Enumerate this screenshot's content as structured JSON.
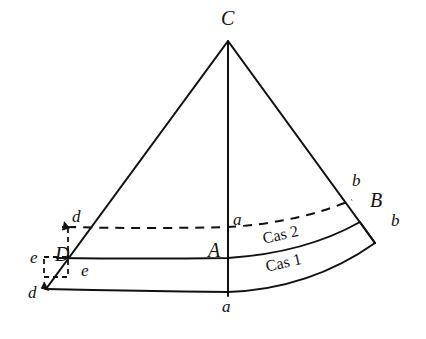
{
  "figure": {
    "background_color": "#ffffff",
    "ink_color": "#111111",
    "width": 426,
    "height": 339
  },
  "labels": {
    "apex_C": "C",
    "vertex_B": "B",
    "vertex_A": "A",
    "vertex_D": "D",
    "upper_right_b": "b",
    "lower_right_b": "b",
    "upper_center_a": "a",
    "lower_center_a": "a",
    "upper_left_d": "d",
    "lower_left_d": "d",
    "upper_left_e": "e",
    "lower_left_e": "e",
    "case_two": "Cas 2",
    "case_one": "Cas 1"
  },
  "geometry": {
    "apex": {
      "x": 228,
      "y": 41
    },
    "left_generatrix_end": {
      "x": 46,
      "y": 289
    },
    "right_generatrix_end": {
      "x": 375,
      "y": 243
    },
    "axis_foot": {
      "x": 228,
      "y": 295
    },
    "arc_dashed_left": {
      "x": 67,
      "y": 226
    },
    "arc_dashed_right": {
      "x": 352,
      "y": 200
    },
    "arc_mid_left": {
      "x": 57,
      "y": 258
    },
    "arc_mid_right": {
      "x": 360,
      "y": 222
    },
    "arc_bottom_left": {
      "x": 46,
      "y": 289
    },
    "arc_bottom_right": {
      "x": 375,
      "y": 243
    },
    "dashed_box_top_left": {
      "x": 44,
      "y": 257
    },
    "dashed_box_corner_e": {
      "x": 68,
      "y": 258
    }
  },
  "strokes": {
    "solid_width": 2.0,
    "dashed_width": 2.0,
    "dash_pattern": "9 7",
    "thin_dash_pattern": "5 4"
  }
}
